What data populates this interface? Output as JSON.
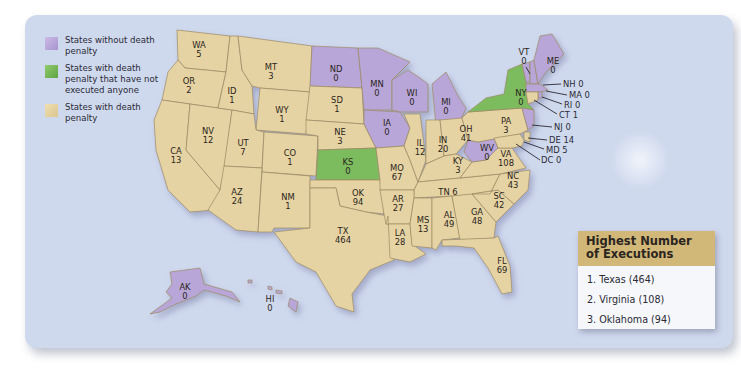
{
  "legend": {
    "items": [
      {
        "label": "States without death penalty",
        "color": "#b8a6d8"
      },
      {
        "label": "States with death penalty that have not executed anyone",
        "color": "#7dbb5e"
      },
      {
        "label": "States with death penalty",
        "color": "#e6d3a3"
      }
    ]
  },
  "colors": {
    "background": "#cfd9ee",
    "no_death_penalty": "#b8a6d8",
    "death_penalty_no_executions": "#7dbb5e",
    "death_penalty": "#e6d3a3",
    "top_box_header": "#d1b778"
  },
  "states": {
    "WA": {
      "abbr": "WA",
      "value": "5"
    },
    "OR": {
      "abbr": "OR",
      "value": "2"
    },
    "CA": {
      "abbr": "CA",
      "value": "13"
    },
    "ID": {
      "abbr": "ID",
      "value": "1"
    },
    "NV": {
      "abbr": "NV",
      "value": "12"
    },
    "MT": {
      "abbr": "MT",
      "value": "3"
    },
    "WY": {
      "abbr": "WY",
      "value": "1"
    },
    "UT": {
      "abbr": "UT",
      "value": "7"
    },
    "AZ": {
      "abbr": "AZ",
      "value": "24"
    },
    "CO": {
      "abbr": "CO",
      "value": "1"
    },
    "NM": {
      "abbr": "NM",
      "value": "1"
    },
    "ND": {
      "abbr": "ND",
      "value": "0"
    },
    "SD": {
      "abbr": "SD",
      "value": "1"
    },
    "NE": {
      "abbr": "NE",
      "value": "3"
    },
    "KS": {
      "abbr": "KS",
      "value": "0"
    },
    "OK": {
      "abbr": "OK",
      "value": "94"
    },
    "TX": {
      "abbr": "TX",
      "value": "464"
    },
    "MN": {
      "abbr": "MN",
      "value": "0"
    },
    "IA": {
      "abbr": "IA",
      "value": "0"
    },
    "MO": {
      "abbr": "MO",
      "value": "67"
    },
    "AR": {
      "abbr": "AR",
      "value": "27"
    },
    "LA": {
      "abbr": "LA",
      "value": "28"
    },
    "WI": {
      "abbr": "WI",
      "value": "0"
    },
    "IL": {
      "abbr": "IL",
      "value": "12"
    },
    "MI": {
      "abbr": "MI",
      "value": "0"
    },
    "IN": {
      "abbr": "IN",
      "value": "20"
    },
    "OH": {
      "abbr": "OH",
      "value": "41"
    },
    "KY": {
      "abbr": "KY",
      "value": "3"
    },
    "TN": {
      "abbr": "TN",
      "value": "6"
    },
    "MS": {
      "abbr": "MS",
      "value": "13"
    },
    "AL": {
      "abbr": "AL",
      "value": "49"
    },
    "GA": {
      "abbr": "GA",
      "value": "48"
    },
    "FL": {
      "abbr": "FL",
      "value": "69"
    },
    "SC": {
      "abbr": "SC",
      "value": "42"
    },
    "NC": {
      "abbr": "NC",
      "value": "43"
    },
    "VA": {
      "abbr": "VA",
      "value": "108"
    },
    "WV": {
      "abbr": "WV",
      "value": "0"
    },
    "PA": {
      "abbr": "PA",
      "value": "3"
    },
    "NY": {
      "abbr": "NY",
      "value": "0"
    },
    "VT": {
      "abbr": "VT",
      "value": "0"
    },
    "ME": {
      "abbr": "ME",
      "value": "0"
    },
    "NH": {
      "abbr": "NH",
      "value": "0"
    },
    "MA": {
      "abbr": "MA",
      "value": "0"
    },
    "RI": {
      "abbr": "RI",
      "value": "0"
    },
    "CT": {
      "abbr": "CT",
      "value": "1"
    },
    "NJ": {
      "abbr": "NJ",
      "value": "0"
    },
    "DE": {
      "abbr": "DE",
      "value": "14"
    },
    "MD": {
      "abbr": "MD",
      "value": "5"
    },
    "DC": {
      "abbr": "DC",
      "value": "0"
    },
    "AK": {
      "abbr": "AK",
      "value": "0"
    },
    "HI": {
      "abbr": "HI",
      "value": "0"
    }
  },
  "callouts": {
    "NH": "NH 0",
    "MA": "MA 0",
    "RI": "RI 0",
    "CT": "CT 1",
    "NJ": "NJ 0",
    "DE": "DE 14",
    "MD": "MD 5",
    "DC": "DC 0",
    "TN": "TN 6"
  },
  "top_executions": {
    "title": "Highest Number of Executions",
    "items": [
      {
        "label": "1.  Texas (464)"
      },
      {
        "label": "2.  Virginia (108)"
      },
      {
        "label": "3.  Oklahoma (94)"
      }
    ]
  }
}
